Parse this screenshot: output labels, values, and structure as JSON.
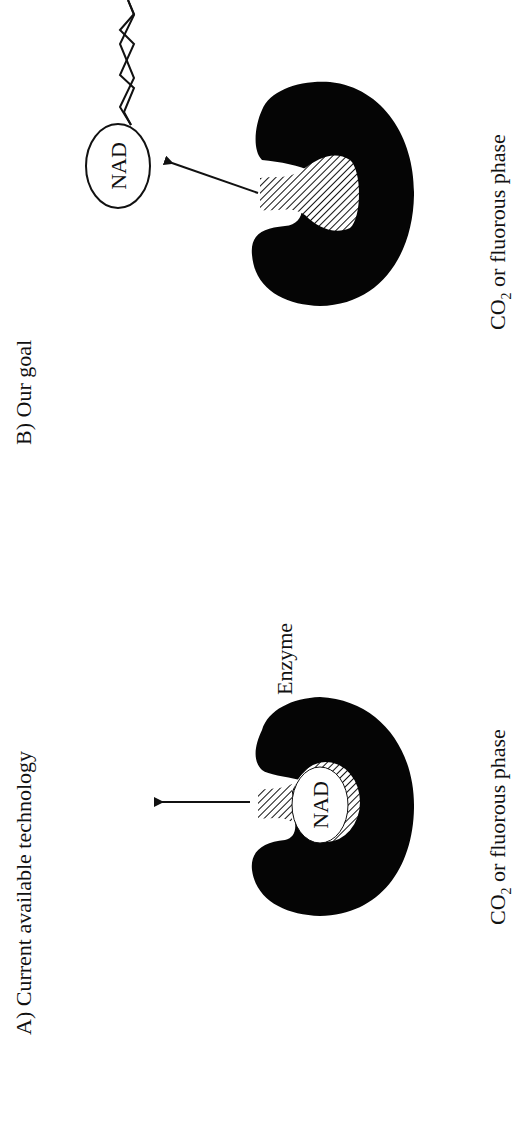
{
  "orientation": "rotated-90-ccw",
  "colors": {
    "ink": "#111111",
    "enzyme": "#050505",
    "background": "#ffffff"
  },
  "panel_a": {
    "title": "A) Current available technology",
    "enzyme_label": "Enzyme",
    "cofactor_label": "NAD",
    "phase_label_prefix": "CO",
    "phase_label_subscript": "2",
    "phase_label_suffix": " or fluorous phase"
  },
  "panel_b": {
    "title": "B) Our goal",
    "cofactor_label": "NAD",
    "phase_label_prefix": "CO",
    "phase_label_subscript": "2",
    "phase_label_suffix": " or fluorous phase"
  }
}
